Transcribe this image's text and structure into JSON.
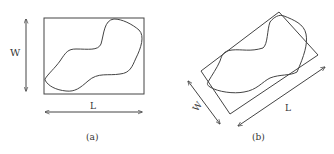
{
  "figure": {
    "panels": [
      {
        "id": "a",
        "caption": "(a)",
        "description": "Irregular blob enclosed by axis-aligned bounding rectangle",
        "width_label": "W",
        "length_label": "L"
      },
      {
        "id": "b",
        "caption": "(b)",
        "description": "Same irregular blob enclosed by rotated minimum bounding rectangle",
        "width_label": "W",
        "length_label": "L"
      }
    ],
    "colors": {
      "stroke": "#444444",
      "background": "#ffffff"
    }
  }
}
